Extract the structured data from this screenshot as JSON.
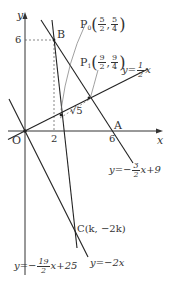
{
  "diagram": {
    "axes": {
      "x_label": "x",
      "y_label": "y",
      "origin_label": "O",
      "x_ticks": [
        "2",
        "6"
      ],
      "y_ticks": [
        "6"
      ]
    },
    "points": {
      "B": {
        "label": "B"
      },
      "A": {
        "label": "A"
      },
      "C": {
        "label": "C(k, −2k)"
      },
      "P0": {
        "name": "P",
        "sub": "0",
        "x_num": "5",
        "x_den": "2",
        "y_num": "5",
        "y_den": "4"
      },
      "P1": {
        "name": "P",
        "sub": "1",
        "x_num": "9",
        "x_den": "2",
        "y_num": "9",
        "y_den": "4"
      }
    },
    "distance_label": "√5",
    "lines": {
      "half": {
        "prefix": "y=",
        "num": "1",
        "den": "2",
        "suffix": "x"
      },
      "ab": {
        "prefix": "y=−",
        "num": "3",
        "den": "2",
        "suffix": "x+9"
      },
      "bc": {
        "prefix": "y=−",
        "num": "19",
        "den": "2",
        "suffix": "x+25"
      },
      "neg2": {
        "text": "y=−2x"
      }
    }
  }
}
